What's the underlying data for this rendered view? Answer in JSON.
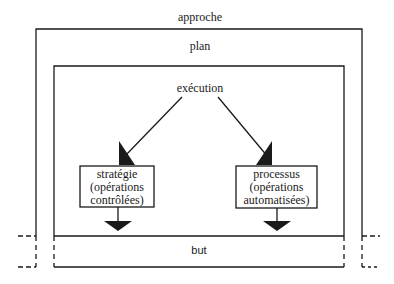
{
  "diagram": {
    "outer_label": "approche",
    "plan_label": "plan",
    "execution_label": "exécution",
    "left_box": {
      "line1": "stratégie",
      "line2": "(opérations",
      "line3": "contrôlées)"
    },
    "right_box": {
      "line1": "processus",
      "line2": "(opérations",
      "line3": "automatisées)"
    },
    "goal_label": "but",
    "line_color": "#1a1a1a"
  }
}
